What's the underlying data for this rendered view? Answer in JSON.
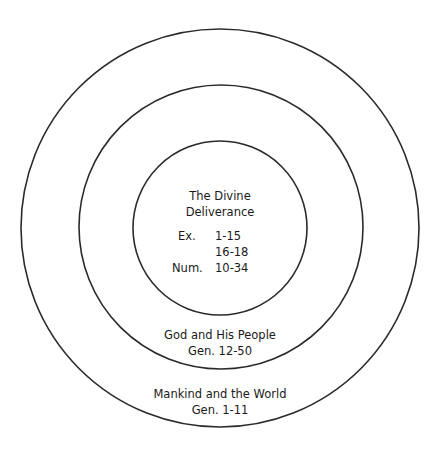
{
  "diagram": {
    "type": "concentric-circles",
    "colors": {
      "background": "#ffffff",
      "stroke": "#2a2a2a",
      "text": "#1a1a1a"
    },
    "rings": [
      {
        "name": "inner",
        "cx": 220,
        "cy": 228,
        "r": 87
      },
      {
        "name": "middle",
        "cx": 221,
        "cy": 227,
        "r": 142
      },
      {
        "name": "outer",
        "cx": 220,
        "cy": 228,
        "r": 199
      }
    ],
    "inner": {
      "title_line1": "The Divine",
      "title_line2": "Deliverance",
      "refs": [
        {
          "book": "Ex.",
          "range": "1-15"
        },
        {
          "book": "",
          "range": "16-18"
        },
        {
          "book": "Num.",
          "range": "10-34"
        }
      ]
    },
    "middle": {
      "title": "God and His People",
      "ref": "Gen. 12-50"
    },
    "outer": {
      "title": "Mankind and the World",
      "ref": "Gen. 1-11"
    }
  }
}
